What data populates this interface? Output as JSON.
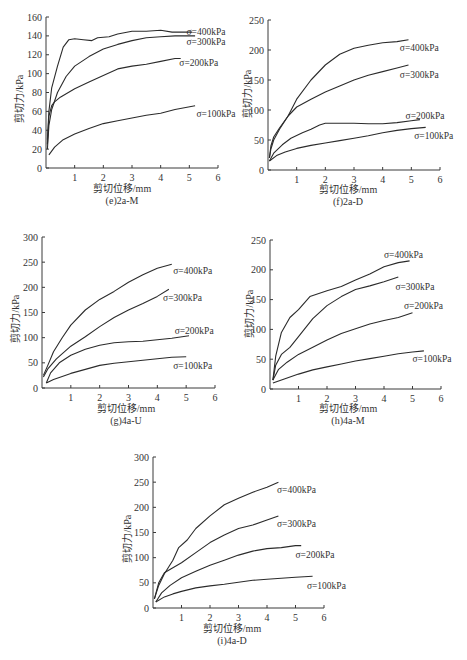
{
  "figure": {
    "series_labels": [
      "σ=100kPa",
      "σ=200kPa",
      "σ=300kPa",
      "σ=400kPa"
    ],
    "xlabel": "剪切位移/mm",
    "ylabel": "剪切力/kPa"
  },
  "chart_data": [
    {
      "id": "e",
      "type": "line",
      "title": "(e)2a-M",
      "xlabel": "剪切位移/mm",
      "ylabel": "剪切力/kPa",
      "xlim": [
        0,
        6
      ],
      "ylim": [
        0,
        160
      ],
      "xticks": [
        1,
        2,
        3,
        4,
        5,
        6
      ],
      "yticks": [
        0,
        20,
        40,
        60,
        80,
        100,
        120,
        140,
        160
      ],
      "grid": false,
      "legend_position": "inline-right",
      "series": [
        {
          "name": "σ=100kPa",
          "x": [
            0.1,
            0.3,
            0.6,
            1.0,
            1.5,
            2.0,
            2.5,
            3.0,
            3.5,
            4.0,
            4.5,
            5.2
          ],
          "y": [
            14,
            22,
            30,
            36,
            42,
            47,
            50,
            53,
            56,
            58,
            62,
            66
          ]
        },
        {
          "name": "σ=200kPa",
          "x": [
            0.05,
            0.1,
            0.2,
            0.3,
            0.5,
            1.0,
            1.5,
            2.0,
            2.5,
            3.0,
            3.5,
            4.0,
            4.5,
            4.7
          ],
          "y": [
            25,
            55,
            66,
            70,
            75,
            84,
            91,
            98,
            105,
            108,
            110,
            113,
            116,
            116
          ]
        },
        {
          "name": "σ=300kPa",
          "x": [
            0.05,
            0.1,
            0.2,
            0.4,
            0.7,
            1.0,
            1.5,
            2.0,
            2.5,
            3.0,
            3.5,
            4.0,
            4.5,
            5.2
          ],
          "y": [
            20,
            45,
            62,
            80,
            97,
            108,
            118,
            126,
            131,
            135,
            138,
            139,
            140,
            140
          ]
        },
        {
          "name": "σ=400kPa",
          "x": [
            0.05,
            0.1,
            0.2,
            0.4,
            0.6,
            0.8,
            1.0,
            1.3,
            1.6,
            1.8,
            2.2,
            2.5,
            3.0,
            3.5,
            4.0,
            4.4,
            5.1
          ],
          "y": [
            30,
            60,
            85,
            108,
            128,
            136,
            137,
            136,
            135,
            138,
            139,
            142,
            145,
            145,
            146,
            144,
            144
          ]
        }
      ],
      "series_label_positions": {
        "σ=100kPa": [
          5.25,
          58
        ],
        "σ=200kPa": [
          4.65,
          112
        ],
        "σ=300kPa": [
          4.9,
          134
        ],
        "σ=400kPa": [
          4.9,
          145
        ]
      }
    },
    {
      "id": "f",
      "type": "line",
      "title": "(f)2a-D",
      "xlabel": "剪切位移/mm",
      "ylabel": "剪切力/kPa",
      "xlim": [
        0,
        6
      ],
      "ylim": [
        0,
        250
      ],
      "xticks": [
        1,
        2,
        3,
        4,
        5,
        6
      ],
      "yticks": [
        0,
        50,
        100,
        150,
        200,
        250
      ],
      "grid": false,
      "legend_position": "inline-right",
      "series": [
        {
          "name": "σ=100kPa",
          "x": [
            0.05,
            0.3,
            0.6,
            1.0,
            1.5,
            2.0,
            2.5,
            3.0,
            3.5,
            4.0,
            4.5,
            5.0,
            5.5
          ],
          "y": [
            15,
            24,
            30,
            36,
            41,
            45,
            49,
            53,
            57,
            62,
            66,
            69,
            71
          ]
        },
        {
          "name": "σ=200kPa",
          "x": [
            0.05,
            0.2,
            0.5,
            0.8,
            1.2,
            1.5,
            1.8,
            2.0,
            2.5,
            3.0,
            3.5,
            4.0,
            4.5,
            5.0,
            5.3
          ],
          "y": [
            15,
            28,
            42,
            53,
            62,
            68,
            75,
            78,
            78,
            78,
            77,
            77,
            79,
            82,
            84
          ]
        },
        {
          "name": "σ=300kPa",
          "x": [
            0.05,
            0.1,
            0.2,
            0.4,
            0.7,
            1.0,
            1.5,
            2.0,
            2.5,
            3.0,
            3.5,
            4.0,
            4.5,
            4.9
          ],
          "y": [
            20,
            40,
            55,
            70,
            90,
            105,
            118,
            130,
            140,
            150,
            158,
            164,
            170,
            175
          ]
        },
        {
          "name": "σ=400kPa",
          "x": [
            0.05,
            0.1,
            0.2,
            0.4,
            0.7,
            1.0,
            1.5,
            2.0,
            2.5,
            3.0,
            3.5,
            4.0,
            4.5,
            4.9
          ],
          "y": [
            20,
            35,
            50,
            68,
            90,
            118,
            150,
            175,
            193,
            203,
            208,
            212,
            214,
            217
          ]
        }
      ],
      "series_label_positions": {
        "σ=100kPa": [
          5.1,
          58
        ],
        "σ=200kPa": [
          4.8,
          91
        ],
        "σ=300kPa": [
          4.6,
          160
        ],
        "σ=400kPa": [
          4.6,
          205
        ]
      }
    },
    {
      "id": "g",
      "type": "line",
      "title": "(g)4a-U",
      "xlabel": "剪切位移/mm",
      "ylabel": "剪切力/kPa",
      "xlim": [
        0,
        6
      ],
      "ylim": [
        0,
        300
      ],
      "xticks": [
        1,
        2,
        3,
        4,
        5,
        6
      ],
      "yticks": [
        0,
        50,
        100,
        150,
        200,
        250,
        300
      ],
      "grid": false,
      "legend_position": "inline-right",
      "series": [
        {
          "name": "σ=100kPa",
          "x": [
            0.15,
            0.4,
            0.7,
            1.0,
            1.5,
            2.0,
            2.5,
            3.0,
            3.5,
            4.0,
            4.5,
            5.0
          ],
          "y": [
            10,
            17,
            23,
            29,
            37,
            45,
            49,
            52,
            55,
            58,
            61,
            62
          ]
        },
        {
          "name": "σ=200kPa",
          "x": [
            0.15,
            0.3,
            0.6,
            1.0,
            1.5,
            2.0,
            2.5,
            3.0,
            3.5,
            4.0,
            4.5,
            5.1
          ],
          "y": [
            10,
            30,
            50,
            65,
            77,
            85,
            90,
            92,
            93,
            96,
            99,
            104
          ]
        },
        {
          "name": "σ=300kPa",
          "x": [
            0.05,
            0.2,
            0.5,
            1.0,
            1.5,
            2.0,
            2.5,
            3.0,
            3.5,
            4.0,
            4.4
          ],
          "y": [
            22,
            38,
            58,
            83,
            102,
            122,
            140,
            155,
            168,
            182,
            196
          ]
        },
        {
          "name": "σ=400kPa",
          "x": [
            0.05,
            0.2,
            0.4,
            0.7,
            1.0,
            1.5,
            2.0,
            2.5,
            3.0,
            3.5,
            4.0,
            4.5
          ],
          "y": [
            25,
            45,
            72,
            100,
            125,
            155,
            176,
            192,
            210,
            225,
            238,
            246
          ]
        }
      ],
      "series_label_positions": {
        "σ=100kPa": [
          4.55,
          45
        ],
        "σ=200kPa": [
          4.6,
          115
        ],
        "σ=300kPa": [
          4.2,
          180
        ],
        "σ=400kPa": [
          4.55,
          233
        ]
      }
    },
    {
      "id": "h",
      "type": "line",
      "title": "(h)4a-M",
      "xlabel": "剪切位移/mm",
      "ylabel": "剪切力/kPa",
      "xlim": [
        0,
        6
      ],
      "ylim": [
        0,
        250
      ],
      "xticks": [
        1,
        2,
        3,
        4,
        5,
        6
      ],
      "yticks": [
        0,
        50,
        100,
        150,
        200,
        250
      ],
      "grid": false,
      "legend_position": "inline-right",
      "series": [
        {
          "name": "σ=100kPa",
          "x": [
            0.1,
            0.5,
            1.0,
            1.5,
            2.0,
            2.5,
            3.0,
            3.5,
            4.0,
            4.5,
            5.0,
            5.4
          ],
          "y": [
            10,
            17,
            25,
            32,
            37,
            42,
            47,
            51,
            55,
            59,
            62,
            64
          ]
        },
        {
          "name": "σ=200kPa",
          "x": [
            0.1,
            0.3,
            0.6,
            1.0,
            1.5,
            2.0,
            2.5,
            3.0,
            3.5,
            4.0,
            4.5,
            5.0
          ],
          "y": [
            15,
            33,
            45,
            58,
            70,
            82,
            93,
            101,
            109,
            115,
            120,
            128
          ]
        },
        {
          "name": "σ=300kPa",
          "x": [
            0.1,
            0.2,
            0.4,
            0.7,
            1.0,
            1.5,
            2.0,
            2.5,
            3.0,
            3.5,
            4.0,
            4.5
          ],
          "y": [
            15,
            40,
            58,
            70,
            88,
            118,
            140,
            155,
            167,
            173,
            180,
            188
          ]
        },
        {
          "name": "σ=400kPa",
          "x": [
            0.1,
            0.2,
            0.4,
            0.7,
            1.0,
            1.4,
            2.0,
            2.5,
            3.0,
            3.5,
            4.0,
            4.5,
            4.9
          ],
          "y": [
            15,
            55,
            95,
            120,
            133,
            155,
            165,
            172,
            183,
            193,
            205,
            212,
            215
          ]
        }
      ],
      "series_label_positions": {
        "σ=100kPa": [
          5.0,
          52
        ],
        "σ=200kPa": [
          4.7,
          140
        ],
        "σ=300kPa": [
          4.4,
          172
        ],
        "σ=400kPa": [
          4.0,
          226
        ]
      }
    },
    {
      "id": "i",
      "type": "line",
      "title": "(i)4a-D",
      "xlabel": "剪切位移/mm",
      "ylabel": "剪切力/kPa",
      "xlim": [
        0,
        6
      ],
      "ylim": [
        0,
        300
      ],
      "xticks": [
        1,
        2,
        3,
        4,
        5,
        6
      ],
      "yticks": [
        0,
        50,
        100,
        150,
        200,
        250,
        300
      ],
      "grid": false,
      "legend_position": "inline-right",
      "series": [
        {
          "name": "σ=100kPa",
          "x": [
            0.1,
            0.4,
            0.7,
            1.0,
            1.5,
            2.0,
            2.5,
            3.0,
            3.5,
            4.0,
            4.5,
            5.0,
            5.6
          ],
          "y": [
            12,
            22,
            28,
            33,
            40,
            44,
            47,
            51,
            55,
            57,
            59,
            61,
            63
          ]
        },
        {
          "name": "σ=200kPa",
          "x": [
            0.1,
            0.3,
            0.6,
            1.0,
            1.5,
            2.0,
            2.5,
            3.0,
            3.5,
            4.0,
            4.5,
            5.0,
            5.2
          ],
          "y": [
            12,
            30,
            45,
            60,
            73,
            85,
            95,
            105,
            113,
            118,
            120,
            124,
            124
          ]
        },
        {
          "name": "σ=300kPa",
          "x": [
            0.05,
            0.2,
            0.4,
            0.7,
            1.0,
            1.5,
            2.0,
            2.5,
            3.0,
            3.5,
            4.0,
            4.4
          ],
          "y": [
            18,
            50,
            70,
            80,
            90,
            110,
            130,
            145,
            158,
            165,
            175,
            183
          ]
        },
        {
          "name": "σ=400kPa",
          "x": [
            0.05,
            0.2,
            0.4,
            0.7,
            0.9,
            1.2,
            1.5,
            2.0,
            2.5,
            3.0,
            3.5,
            4.0,
            4.4
          ],
          "y": [
            18,
            45,
            68,
            95,
            120,
            135,
            158,
            183,
            205,
            218,
            230,
            240,
            250
          ]
        }
      ],
      "series_label_positions": {
        "σ=100kPa": [
          5.4,
          45
        ],
        "σ=200kPa": [
          5.0,
          107
        ],
        "σ=300kPa": [
          4.35,
          168
        ],
        "σ=400kPa": [
          4.35,
          236
        ]
      }
    }
  ]
}
